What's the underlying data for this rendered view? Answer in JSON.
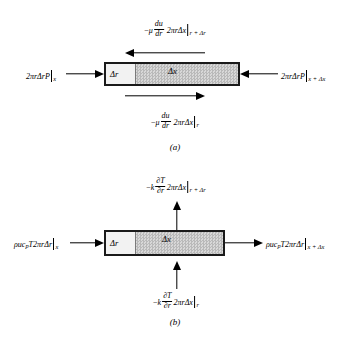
{
  "figure": {
    "type": "control-volume-diagram",
    "panels": [
      {
        "id": "a",
        "caption": "(a)",
        "balance": "momentum",
        "box": {
          "dr_label": "Δr",
          "dx_label": "Δx"
        },
        "labels": {
          "top": {
            "text": "−μ du/dr 2πrΔx |r+Δr",
            "minus": "−",
            "mu": "μ",
            "num": "du",
            "den": "dr",
            "factor": "2πrΔx",
            "eval_at": "r + Δr",
            "eval_main": "r",
            "eval_extra": " + Δr"
          },
          "left": {
            "text": "2πrΔrP|x",
            "factor": "2πrΔrP",
            "eval_at": "x"
          },
          "right": {
            "text": "2πrΔrP|x+Δx",
            "factor": "2πrΔrP",
            "eval_at": "x + Δx",
            "eval_main": "x",
            "eval_extra": " + Δx"
          },
          "bottom": {
            "text": "−μ du/dr 2πrΔx |r",
            "minus": "−",
            "mu": "μ",
            "num": "du",
            "den": "dr",
            "factor": "2πrΔx",
            "eval_at": "r"
          }
        },
        "arrows": {
          "top": "left",
          "bottom": "right",
          "left": "right",
          "right": "left"
        }
      },
      {
        "id": "b",
        "caption": "(b)",
        "balance": "energy",
        "box": {
          "dr_label": "Δr",
          "dx_label": "Δx"
        },
        "labels": {
          "top": {
            "text": "−k ∂T/∂r 2πrΔx |r+Δr",
            "minus": "−",
            "k": "k",
            "num": "∂T",
            "den": "∂r",
            "factor": "2πrΔx",
            "eval_at": "r + Δr",
            "eval_main": "r",
            "eval_extra": " + Δr"
          },
          "left": {
            "text": "ρucₚT 2πrΔr|x",
            "rho": "ρu",
            "c": "c",
            "c_sub": "p",
            "T": "T",
            "factor": "2πrΔr",
            "eval_at": "x"
          },
          "right": {
            "text": "ρucₚT 2πrΔr|x+Δx",
            "rho": "ρu",
            "c": "c",
            "c_sub": "p",
            "T": "T",
            "factor": "2πrΔr",
            "eval_at": "x + Δx",
            "eval_main": "x",
            "eval_extra": " + Δx"
          },
          "bottom": {
            "text": "−k ∂T/∂r 2πrΔx |r",
            "minus": "−",
            "k": "k",
            "num": "∂T",
            "den": "∂r",
            "factor": "2πrΔx",
            "eval_at": "r"
          }
        },
        "arrows": {
          "top": "up",
          "bottom": "up",
          "left": "right",
          "right": "right"
        }
      }
    ]
  },
  "colors": {
    "background": "#ffffff",
    "ink": "#000000",
    "box_border": "#1a1a1a",
    "box_fill": "#cccccc",
    "dr_cell_fill": "#f2f2f2"
  }
}
